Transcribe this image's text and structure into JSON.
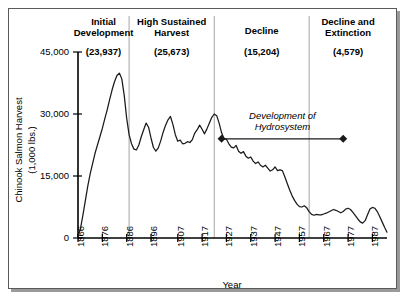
{
  "figure": {
    "name": "chinook-salmon-harvest-chart",
    "border_color": "#5a5a5a",
    "line_color": "#1a1a1a",
    "divider_color": "#9b9b9b"
  },
  "chart_data": {
    "type": "line",
    "title": "",
    "xlabel": "Year",
    "ylabel_line1": "Chinook Salmon Harvest",
    "ylabel_line2": "(1,000 lbs.)",
    "xlim": [
      1866,
      1993
    ],
    "ylim": [
      0,
      45000
    ],
    "grid": false,
    "legend": "none",
    "ytick_labels": [
      "45,000",
      "30,000",
      "15,000",
      "0"
    ],
    "ytick_values": [
      45000,
      30000,
      15000,
      0
    ],
    "xtick_labels": [
      "1866",
      "1876",
      "1886",
      "1896",
      "1907",
      "1917",
      "1927",
      "1937",
      "1947",
      "1957",
      "1967",
      "1977",
      "1987"
    ],
    "xtick_values": [
      1866,
      1876,
      1886,
      1896,
      1907,
      1917,
      1927,
      1937,
      1947,
      1957,
      1967,
      1977,
      1987
    ],
    "series": [
      {
        "name": "Chinook Salmon Harvest",
        "x": [
          1866,
          1867,
          1868,
          1869,
          1870,
          1871,
          1872,
          1873,
          1874,
          1875,
          1876,
          1877,
          1878,
          1879,
          1880,
          1881,
          1882,
          1883,
          1884,
          1885,
          1886,
          1887,
          1888,
          1889,
          1890,
          1891,
          1892,
          1893,
          1894,
          1895,
          1896,
          1897,
          1898,
          1899,
          1900,
          1901,
          1902,
          1903,
          1904,
          1905,
          1906,
          1907,
          1908,
          1909,
          1910,
          1911,
          1912,
          1913,
          1914,
          1915,
          1916,
          1917,
          1918,
          1919,
          1920,
          1921,
          1922,
          1923,
          1924,
          1925,
          1926,
          1927,
          1928,
          1929,
          1930,
          1931,
          1932,
          1933,
          1934,
          1935,
          1936,
          1937,
          1938,
          1939,
          1940,
          1941,
          1942,
          1943,
          1944,
          1945,
          1946,
          1947,
          1948,
          1949,
          1950,
          1951,
          1952,
          1953,
          1954,
          1955,
          1956,
          1957,
          1958,
          1959,
          1960,
          1961,
          1962,
          1963,
          1964,
          1965,
          1966,
          1967,
          1968,
          1969,
          1970,
          1971,
          1972,
          1973,
          1974,
          1975,
          1976,
          1977,
          1978,
          1979,
          1980,
          1981,
          1982,
          1983,
          1984,
          1985,
          1986,
          1987,
          1988,
          1989,
          1990,
          1991,
          1992,
          1993
        ],
        "values": [
          272,
          2200,
          5500,
          9000,
          12500,
          15500,
          18000,
          20500,
          22500,
          24500,
          26500,
          28800,
          31000,
          33500,
          35800,
          37800,
          39300,
          39900,
          38500,
          34500,
          29000,
          25000,
          22800,
          21500,
          21300,
          22500,
          24500,
          26200,
          27800,
          26800,
          24200,
          21900,
          21000,
          21800,
          23500,
          25600,
          27300,
          28600,
          29400,
          27500,
          25000,
          23400,
          23700,
          22800,
          22900,
          23300,
          23100,
          23800,
          25400,
          26200,
          27300,
          26300,
          25200,
          26400,
          27800,
          29200,
          30000,
          29600,
          27800,
          25500,
          24000,
          23900,
          22800,
          22000,
          21800,
          22400,
          21000,
          20500,
          20900,
          19800,
          19300,
          19600,
          18600,
          18000,
          18400,
          17600,
          17200,
          17600,
          16900,
          16200,
          16500,
          17200,
          16300,
          16500,
          16300,
          14800,
          13200,
          11600,
          10200,
          9100,
          8200,
          7600,
          7500,
          7800,
          7300,
          6400,
          5700,
          5500,
          5700,
          5600,
          5600,
          5800,
          6000,
          6300,
          6600,
          6900,
          6700,
          6400,
          6100,
          6400,
          7000,
          7200,
          6900,
          6200,
          5400,
          4600,
          3900,
          3600,
          4200,
          5600,
          7000,
          7400,
          7200,
          6400,
          5200,
          3900,
          2600,
          1400
        ]
      }
    ],
    "annotations": [
      {
        "name": "hydrosystem-annotation",
        "text_line1": "Development of",
        "text_line2": "Hydrosystem",
        "style": "italic",
        "arrow_start_year": 1925,
        "arrow_end_year": 1975,
        "arrow_y_value": 24000,
        "marker": "diamond-both-ends"
      }
    ],
    "phases": [
      {
        "name": "initial-development",
        "title_line1": "Initial",
        "title_line2": "Development",
        "mean_value": "(23,937)",
        "start_year": 1866,
        "end_year": 1887
      },
      {
        "name": "high-sustained-harvest",
        "title_line1": "High Sustained",
        "title_line2": "Harvest",
        "mean_value": "(25,673)",
        "start_year": 1887,
        "end_year": 1922
      },
      {
        "name": "decline",
        "title_line1": "Decline",
        "title_line2": "",
        "mean_value": "(15,204)",
        "start_year": 1922,
        "end_year": 1961
      },
      {
        "name": "decline-and-extinction",
        "title_line1": "Decline and",
        "title_line2": "Extinction",
        "mean_value": "(4,579)",
        "start_year": 1961,
        "end_year": 1993
      }
    ]
  }
}
